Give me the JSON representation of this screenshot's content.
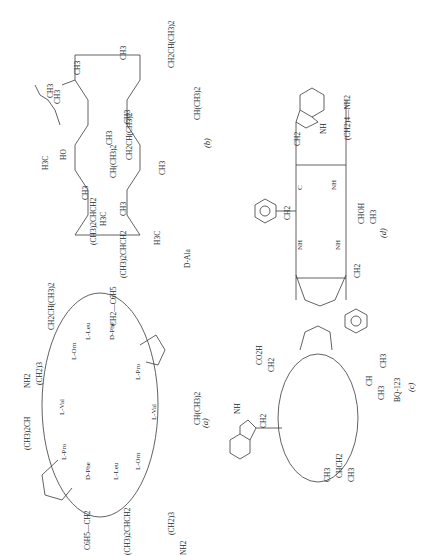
{
  "figure": {
    "orientation": "rotated-90-clockwise",
    "panels": [
      {
        "id": "a",
        "caption": "(a)",
        "residue_labels": [
          "L-Val",
          "L-Orn",
          "L-Leu",
          "D-Phe",
          "L-Pro",
          "L-Val",
          "L-Orn",
          "L-Leu",
          "D-Phe",
          "L-Pro"
        ],
        "group_labels": [
          "NH2",
          "(CH2)3",
          "CH2CH(CH3)2",
          "CH2—C6H5",
          "(CH3)2CH",
          "CH(CH3)2",
          "C6H5—CH2",
          "(CH3)2CHCH2",
          "(CH2)3",
          "NH2"
        ],
        "backbone_labels": [
          "NH",
          "C",
          "O",
          "CH",
          "NH",
          "C",
          "O",
          "NH",
          "CH",
          "C",
          "O",
          "N",
          "CH",
          "C",
          "O",
          "HN",
          "CH",
          "C",
          "O",
          "NH",
          "CH",
          "C",
          "O",
          "NH",
          "CH",
          "C",
          "O",
          "NH",
          "CH",
          "C",
          "O",
          "N",
          "CH",
          "C",
          "O",
          "NH",
          "CH",
          "C",
          "O"
        ]
      },
      {
        "id": "b",
        "caption": "(b)",
        "residue_note": "D-Ala",
        "group_labels": [
          "H3C",
          "HO",
          "CH3",
          "CH3",
          "CH3",
          "CH(CH3)2",
          "CH3",
          "(CH3)2CHCH2",
          "H3C",
          "(CH3)2CHCH2",
          "H3C",
          "CH3",
          "CH3",
          "CH2CH(CH3)2",
          "CH3",
          "CH(CH3)2",
          "CH3",
          "CH2CH(CH3)2",
          "CH3"
        ],
        "backbone_labels": [
          "N",
          "O",
          "N",
          "O",
          "H",
          "N",
          "O",
          "N",
          "O",
          "N",
          "O",
          "N",
          "O",
          "N",
          "H",
          "O",
          "N",
          "H",
          "O",
          "N",
          "O",
          "N",
          "H",
          "O",
          "N",
          "O"
        ]
      },
      {
        "id": "c",
        "caption": "(c)",
        "compound_name": "BQ-123",
        "group_labels": [
          "CO2H",
          "CH2",
          "CH2",
          "NH",
          "CH3",
          "CH",
          "CH3",
          "CH3",
          "CHCH2",
          "CH3"
        ],
        "backbone_labels": [
          "CH",
          "C",
          "O",
          "N",
          "C",
          "O",
          "NH",
          "CH",
          "C",
          "O",
          "NH",
          "CH",
          "C",
          "O",
          "NH",
          "CH",
          "C",
          "O",
          "NH"
        ]
      },
      {
        "id": "d",
        "caption": "(d)",
        "group_labels": [
          "NH",
          "CH2",
          "CH2",
          "(CH2)4—NH2",
          "CHOH",
          "CH3",
          "CH2"
        ],
        "backbone_labels": [
          "CH",
          "CH",
          "NH",
          "C",
          "O",
          "C",
          "O",
          "NH",
          "CH",
          "CH",
          "C",
          "O",
          "NH",
          "CH",
          "C",
          "O",
          "NH",
          "CH",
          "C",
          "O",
          "N",
          "CH",
          "C",
          "O",
          "NH",
          "CH",
          "NH"
        ]
      }
    ]
  }
}
